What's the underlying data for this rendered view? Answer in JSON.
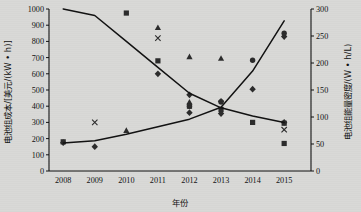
{
  "chart_data": {
    "type": "scatter",
    "title": "",
    "xlabel": "年份",
    "ylabel": "电池组成本/[美元/(kW • h)]",
    "y2label": "电池组能量密度/(W • h/L)",
    "x": [
      2008,
      2009,
      2010,
      2011,
      2012,
      2013,
      2014,
      2015
    ],
    "xticklabels": [
      "2008",
      "2009",
      "2010",
      "2011",
      "2012",
      "2013",
      "2014",
      "2015"
    ],
    "ylim": [
      0,
      1000
    ],
    "yticks": [
      0,
      100,
      200,
      300,
      400,
      500,
      600,
      700,
      800,
      900,
      1000
    ],
    "yticklabels": [
      "0",
      "100",
      "200",
      "300",
      "400",
      "500",
      "600",
      "700",
      "800",
      "900",
      "1000"
    ],
    "y2lim": [
      0,
      300
    ],
    "y2ticks": [
      0,
      50,
      100,
      150,
      200,
      250,
      300
    ],
    "y2ticklabels": [
      "0",
      "50",
      "100",
      "150",
      "200",
      "250",
      "300"
    ],
    "grid": false,
    "legend": "none",
    "series": [
      {
        "name": "电池组成本趋势线",
        "type": "line",
        "axis": "left",
        "x": [
          2008,
          2009,
          2010,
          2011,
          2012,
          2013,
          2014,
          2015
        ],
        "values": [
          1000,
          960,
          800,
          640,
          480,
          390,
          340,
          300
        ]
      },
      {
        "name": "电池组能量密度趋势线",
        "type": "line",
        "axis": "right",
        "x": [
          2008,
          2009,
          2010,
          2011,
          2012,
          2013,
          2014,
          2015
        ],
        "values": [
          52,
          56,
          68,
          82,
          96,
          118,
          185,
          278
        ]
      },
      {
        "name": "成本散点-方块",
        "type": "scatter",
        "axis": "left",
        "marker": "square",
        "points": [
          {
            "x": 2008,
            "y": 180
          },
          {
            "x": 2010,
            "y": 975
          },
          {
            "x": 2011,
            "y": 680
          },
          {
            "x": 2012,
            "y": 400
          },
          {
            "x": 2013,
            "y": 380
          },
          {
            "x": 2014,
            "y": 300
          },
          {
            "x": 2015,
            "y": 295
          },
          {
            "x": 2015,
            "y": 170
          }
        ]
      },
      {
        "name": "成本散点-三角",
        "type": "scatter",
        "axis": "left",
        "marker": "triangle",
        "points": [
          {
            "x": 2010,
            "y": 250
          },
          {
            "x": 2011,
            "y": 885
          },
          {
            "x": 2012,
            "y": 705
          },
          {
            "x": 2012,
            "y": 425
          },
          {
            "x": 2013,
            "y": 695
          }
        ]
      },
      {
        "name": "成本散点-菱形",
        "type": "scatter",
        "axis": "left",
        "marker": "diamond",
        "points": [
          {
            "x": 2008,
            "y": 175
          },
          {
            "x": 2009,
            "y": 150
          },
          {
            "x": 2011,
            "y": 600
          },
          {
            "x": 2012,
            "y": 470
          },
          {
            "x": 2012,
            "y": 360
          },
          {
            "x": 2013,
            "y": 430
          },
          {
            "x": 2013,
            "y": 355
          },
          {
            "x": 2014,
            "y": 505
          },
          {
            "x": 2015,
            "y": 830
          },
          {
            "x": 2015,
            "y": 300
          }
        ]
      },
      {
        "name": "成本散点-叉号",
        "type": "scatter",
        "axis": "left",
        "marker": "cross",
        "points": [
          {
            "x": 2009,
            "y": 300
          },
          {
            "x": 2011,
            "y": 820
          },
          {
            "x": 2015,
            "y": 255
          }
        ]
      },
      {
        "name": "能量密度散点",
        "type": "scatter",
        "axis": "right",
        "marker": "circle",
        "points": [
          {
            "x": 2012,
            "y": 120
          },
          {
            "x": 2013,
            "y": 128
          },
          {
            "x": 2014,
            "y": 205
          },
          {
            "x": 2015,
            "y": 255
          }
        ]
      }
    ]
  }
}
